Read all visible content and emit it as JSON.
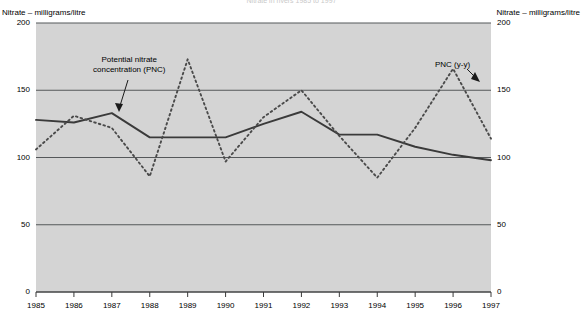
{
  "chart_title": "Nitrate in rivers 1985 to 1997",
  "axis": {
    "left_caption": "Nitrate – milligrams/litre",
    "right_caption": "Nitrate – milligrams/litre",
    "y_ticks": [
      "200",
      "150",
      "100",
      "50",
      "0"
    ],
    "x_ticks": [
      "1985",
      "1986",
      "1987",
      "1988",
      "1989",
      "1990",
      "1991",
      "1992",
      "1993",
      "1994",
      "1995",
      "1996",
      "1997"
    ]
  },
  "annotations": {
    "pnc_line1": "Potential nitrate",
    "pnc_line2": "concentration (PNC)",
    "pnc_yy": "PNC (y-y)"
  },
  "colors": {
    "plot_background": "#d4d4d4",
    "gridline": "#55585a",
    "pnc_line": "#3a3a3a",
    "pnc_yy_line": "#4a4a4a",
    "text": "#000000"
  },
  "chart_data": {
    "type": "line",
    "title": "Nitrate in rivers 1985 to 1997",
    "xlabel": "",
    "ylabel": "Nitrate – milligrams/litre",
    "ylim": [
      0,
      200
    ],
    "yticks": [
      0,
      50,
      100,
      150,
      200
    ],
    "grid": true,
    "legend": "annotations",
    "x": [
      1985,
      1986,
      1987,
      1988,
      1989,
      1990,
      1991,
      1992,
      1993,
      1994,
      1995,
      1996,
      1997
    ],
    "series": [
      {
        "name": "Potential nitrate concentration (PNC)",
        "style": "solid",
        "values": [
          128,
          126,
          133,
          115,
          115,
          115,
          125,
          134,
          117,
          117,
          108,
          102,
          98
        ]
      },
      {
        "name": "PNC (y-y)",
        "style": "dashed",
        "values": [
          106,
          131,
          122,
          86,
          173,
          97,
          130,
          150,
          116,
          85,
          122,
          166,
          114
        ]
      }
    ]
  }
}
